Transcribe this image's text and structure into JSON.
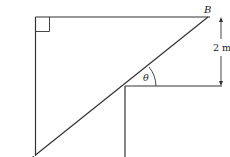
{
  "diagram": {
    "labels": {
      "point_a": "A",
      "point_b": "B",
      "angle": "θ",
      "dimension": "2 m"
    },
    "colors": {
      "stroke": "#333333",
      "background": "#ffffff"
    }
  }
}
